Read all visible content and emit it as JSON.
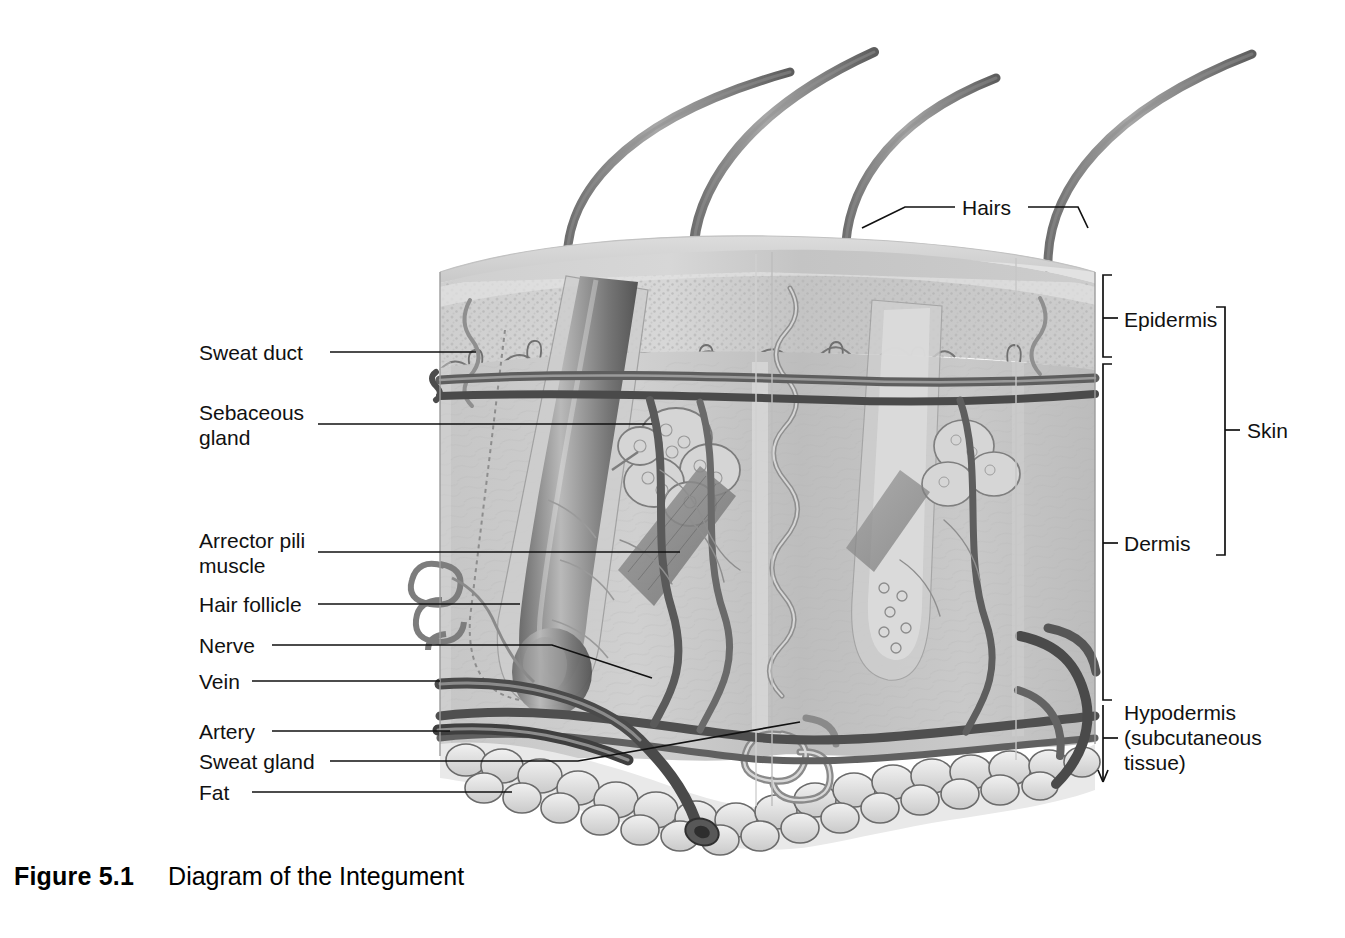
{
  "figure": {
    "number_label": "Figure 5.1",
    "title": "Diagram of the Integument",
    "background_color": "#ffffff",
    "ink_color": "#111111"
  },
  "diagram": {
    "structures": [
      "hairs",
      "epidermis",
      "dermis",
      "hypodermis",
      "fat-lobules",
      "hair-follicle",
      "sebaceous-gland",
      "arrector-pili-muscle",
      "sweat-duct",
      "sweat-gland",
      "nerve",
      "vein",
      "artery"
    ]
  },
  "left_labels": [
    {
      "id": "sweat-duct",
      "text": "Sweat duct",
      "lines": [
        "Sweat duct"
      ]
    },
    {
      "id": "sebaceous-gland",
      "text": "Sebaceous gland",
      "lines": [
        "Sebaceous",
        "gland"
      ]
    },
    {
      "id": "arrector-pili-muscle",
      "text": "Arrector pili muscle",
      "lines": [
        "Arrector pili",
        "muscle"
      ]
    },
    {
      "id": "hair-follicle",
      "text": "Hair follicle",
      "lines": [
        "Hair follicle"
      ]
    },
    {
      "id": "nerve",
      "text": "Nerve",
      "lines": [
        "Nerve"
      ]
    },
    {
      "id": "vein",
      "text": "Vein",
      "lines": [
        "Vein"
      ]
    },
    {
      "id": "artery",
      "text": "Artery",
      "lines": [
        "Artery"
      ]
    },
    {
      "id": "sweat-gland",
      "text": "Sweat gland",
      "lines": [
        "Sweat gland"
      ]
    },
    {
      "id": "fat",
      "text": "Fat",
      "lines": [
        "Fat"
      ]
    }
  ],
  "top_labels": [
    {
      "id": "hairs",
      "text": "Hairs"
    }
  ],
  "right_labels": [
    {
      "id": "epidermis",
      "text": "Epidermis",
      "lines": [
        "Epidermis"
      ]
    },
    {
      "id": "dermis",
      "text": "Dermis",
      "lines": [
        "Dermis"
      ]
    },
    {
      "id": "skin",
      "text": "Skin",
      "lines": [
        "Skin"
      ]
    },
    {
      "id": "hypodermis",
      "text": "Hypodermis (subcutaneous tissue)",
      "lines": [
        "Hypodermis",
        "(subcutaneous",
        "tissue)"
      ]
    }
  ],
  "text": {
    "sweat_duct": "Sweat duct",
    "sebaceous_1": "Sebaceous",
    "sebaceous_2": "gland",
    "arrector_1": "Arrector pili",
    "arrector_2": "muscle",
    "hair_follicle": "Hair follicle",
    "nerve": "Nerve",
    "vein": "Vein",
    "artery": "Artery",
    "sweat_gland": "Sweat gland",
    "fat": "Fat",
    "hairs": "Hairs",
    "epidermis": "Epidermis",
    "dermis": "Dermis",
    "skin": "Skin",
    "hypo_1": "Hypodermis",
    "hypo_2": "(subcutaneous",
    "hypo_3": "tissue)",
    "figure_number": "Figure 5.1",
    "figure_title": "Diagram of the Integument"
  }
}
